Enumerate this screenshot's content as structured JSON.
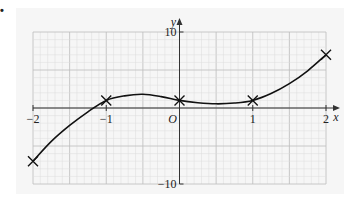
{
  "question_marker": "•",
  "chart_data": {
    "type": "line",
    "title": "",
    "xlabel": "x",
    "ylabel": "y",
    "xlim": [
      -2,
      2
    ],
    "ylim": [
      -10,
      10
    ],
    "grid": true,
    "origin_label": "O",
    "x_ticks": [
      {
        "value": -2,
        "label": "−2"
      },
      {
        "value": -1,
        "label": "−1"
      },
      {
        "value": 1,
        "label": "1"
      },
      {
        "value": 2,
        "label": "2"
      }
    ],
    "y_ticks": [
      {
        "value": 10,
        "label": "10"
      },
      {
        "value": -10,
        "label": "−10"
      }
    ],
    "marked_points": [
      {
        "x": -2,
        "y": -7
      },
      {
        "x": -1,
        "y": 1
      },
      {
        "x": 0,
        "y": 1
      },
      {
        "x": 1,
        "y": 1
      },
      {
        "x": 2,
        "y": 7
      }
    ],
    "curve": {
      "description": "smooth cubic through marked points",
      "x": [
        -2,
        -1.75,
        -1.5,
        -1.25,
        -1,
        -0.75,
        -0.5,
        -0.25,
        0,
        0.25,
        0.5,
        0.75,
        1,
        1.25,
        1.5,
        1.75,
        2
      ],
      "y": [
        -7,
        -4.4,
        -2.3,
        -0.5,
        1,
        1.6,
        1.8,
        1.5,
        1,
        0.7,
        0.55,
        0.65,
        1,
        1.9,
        3.2,
        4.9,
        7
      ]
    },
    "colors": {
      "background_panel": "#f6f6f6",
      "grid_minor": "#dcdcdc",
      "grid_major": "#bdbdbd",
      "axis": "#333333",
      "curve": "#111111"
    }
  }
}
